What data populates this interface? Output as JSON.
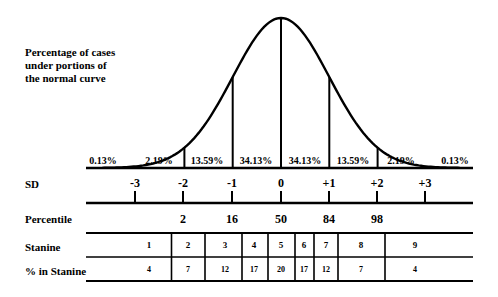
{
  "title_lines": [
    "Percentage of cases",
    "under portions of",
    "the normal curve"
  ],
  "area_percentages": [
    "0.13%",
    "2.19%",
    "13.59%",
    "34.13%",
    "34.13%",
    "13.59%",
    "2.19%",
    "0.13%"
  ],
  "row_labels": {
    "sd": "SD",
    "percentile": "Percentile",
    "stanine": "Stanine",
    "pct_in_stanine": "% in Stanine"
  },
  "sd_ticks": [
    "-3",
    "-2",
    "-1",
    "0",
    "+1",
    "+2",
    "+3"
  ],
  "percentiles": [
    "2",
    "16",
    "50",
    "84",
    "98"
  ],
  "stanines": [
    "1",
    "2",
    "3",
    "4",
    "5",
    "6",
    "7",
    "8",
    "9"
  ],
  "pct_in_stanine": [
    "4",
    "7",
    "12",
    "17",
    "20",
    "17",
    "12",
    "7",
    "4"
  ],
  "colors": {
    "ink": "#000000",
    "background": "#ffffff"
  },
  "chart_data": {
    "type": "area",
    "title": "Percentage of cases under portions of the normal curve",
    "x": [
      -3,
      -2,
      -1,
      0,
      1,
      2,
      3
    ],
    "xlabel": "SD",
    "regions": [
      {
        "from": "-inf",
        "to": -3,
        "percent": 0.13
      },
      {
        "from": -3,
        "to": -2,
        "percent": 2.19
      },
      {
        "from": -2,
        "to": -1,
        "percent": 13.59
      },
      {
        "from": -1,
        "to": 0,
        "percent": 34.13
      },
      {
        "from": 0,
        "to": 1,
        "percent": 34.13
      },
      {
        "from": 1,
        "to": 2,
        "percent": 13.59
      },
      {
        "from": 2,
        "to": 3,
        "percent": 2.19
      },
      {
        "from": 3,
        "to": "inf",
        "percent": 0.13
      }
    ],
    "percentile_at_sd": {
      "-2": 2,
      "-1": 16,
      "0": 50,
      "1": 84,
      "2": 98
    },
    "stanine_percent": {
      "1": 4,
      "2": 7,
      "3": 12,
      "4": 17,
      "5": 20,
      "6": 17,
      "7": 12,
      "8": 7,
      "9": 4
    },
    "grid": false,
    "legend": null
  }
}
